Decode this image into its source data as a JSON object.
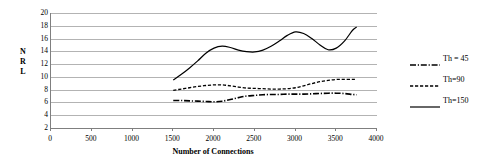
{
  "chart_data": {
    "type": "line",
    "title": "",
    "xlabel": "Number of Connections",
    "ylabel": "NRL",
    "ylabel_chars": [
      "N",
      "R",
      "L"
    ],
    "xlim": [
      0,
      4000
    ],
    "ylim": [
      2,
      20
    ],
    "xticks": [
      0,
      500,
      1000,
      1500,
      2000,
      2500,
      3000,
      3500,
      4000
    ],
    "yticks": [
      2,
      4,
      6,
      8,
      10,
      12,
      14,
      16,
      18,
      20
    ],
    "xtick_labels": [
      "0",
      "500",
      "1000",
      "1500",
      "2000",
      "2500",
      "3000",
      "3500",
      "4000"
    ],
    "ytick_labels": [
      "2",
      "4",
      "6",
      "8",
      "10",
      "12",
      "14",
      "16",
      "18",
      "20"
    ],
    "grid": true,
    "grid_color": "#b3b3b3",
    "legend_position": "right",
    "line_color": "#000000",
    "x": [
      1500,
      1600,
      1700,
      1800,
      1900,
      2000,
      2100,
      2200,
      2300,
      2400,
      2500,
      2600,
      2700,
      2800,
      2900,
      3000,
      3100,
      3200,
      3300,
      3400,
      3500,
      3600,
      3700,
      3750
    ],
    "series": [
      {
        "name": "Th = 45",
        "key": "th45",
        "style": "dash-dot",
        "values": [
          6.3,
          6.3,
          6.25,
          6.2,
          6.15,
          6.1,
          6.2,
          6.45,
          6.75,
          7.0,
          7.1,
          7.2,
          7.25,
          7.25,
          7.3,
          7.3,
          7.3,
          7.35,
          7.4,
          7.45,
          7.45,
          7.4,
          7.25,
          7.2
        ]
      },
      {
        "name": "Th=90",
        "key": "th90",
        "style": "dashed",
        "values": [
          7.9,
          8.1,
          8.3,
          8.5,
          8.65,
          8.75,
          8.75,
          8.6,
          8.4,
          8.25,
          8.2,
          8.15,
          8.1,
          8.1,
          8.15,
          8.3,
          8.6,
          8.95,
          9.25,
          9.45,
          9.6,
          9.6,
          9.6,
          9.6
        ]
      },
      {
        "name": "Th=150",
        "key": "th150",
        "style": "solid",
        "values": [
          9.5,
          10.4,
          11.4,
          12.5,
          13.7,
          14.5,
          14.8,
          14.6,
          14.2,
          13.95,
          13.9,
          14.2,
          14.8,
          15.6,
          16.5,
          17.05,
          16.8,
          16.0,
          15.0,
          14.25,
          14.5,
          15.6,
          17.3,
          17.8
        ]
      }
    ]
  },
  "legend": {
    "entries": [
      {
        "label": "Th = 45",
        "style": "dash-dot"
      },
      {
        "label": "Th=90",
        "style": "dashed"
      },
      {
        "label": "Th=150",
        "style": "solid"
      }
    ]
  }
}
